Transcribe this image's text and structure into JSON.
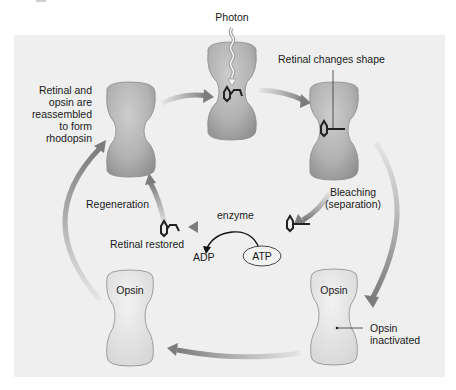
{
  "labels": {
    "photon": "Photon",
    "retinal_changes_shape": "Retinal changes shape",
    "reassembled": [
      "Retinal and",
      "opsin are",
      "reassembled",
      "to form",
      "rhodopsin"
    ],
    "bleaching": [
      "Bleaching",
      "(separation)"
    ],
    "regeneration": "Regeneration",
    "enzyme": "enzyme",
    "retinal_restored": "Retinal restored",
    "adp": "ADP",
    "atp": "ATP",
    "opsin_left": "Opsin",
    "opsin_right": "Opsin",
    "opsin_inactivated": [
      "Opsin",
      "inactivated"
    ]
  },
  "colors": {
    "panel_bg": "#efefef",
    "rhodopsin_fill": "#b4b4b4",
    "opsin_fill": "#e2e2e2",
    "arrow": "#8c8c8c",
    "text": "#1a1a1a"
  }
}
